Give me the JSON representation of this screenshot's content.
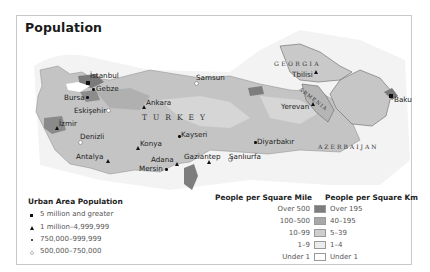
{
  "title": "Population",
  "countries": {
    "turkey": "TURKEY",
    "georgia": "GEORGIA",
    "armenia": "ARMENIA",
    "azerbaijan": "AZERBAIJAN"
  },
  "cities": [
    {
      "name": "İstanbul",
      "marker": "square"
    },
    {
      "name": "Gebze",
      "marker": "dot"
    },
    {
      "name": "Bursa",
      "marker": "dot"
    },
    {
      "name": "Eskişehir",
      "marker": "ring"
    },
    {
      "name": "İzmir",
      "marker": "triangle"
    },
    {
      "name": "Denizli",
      "marker": "ring"
    },
    {
      "name": "Antalya",
      "marker": "triangle"
    },
    {
      "name": "Ankara",
      "marker": "triangle"
    },
    {
      "name": "Samsun",
      "marker": "ring"
    },
    {
      "name": "Kayseri",
      "marker": "dot"
    },
    {
      "name": "Konya",
      "marker": "triangle"
    },
    {
      "name": "Adana",
      "marker": "triangle"
    },
    {
      "name": "Mersin",
      "marker": "dot"
    },
    {
      "name": "Gaziantep",
      "marker": "triangle"
    },
    {
      "name": "Şanlıurfa",
      "marker": "ring"
    },
    {
      "name": "Diyarbakır",
      "marker": "dot"
    },
    {
      "name": "Tbilisi",
      "marker": "triangle"
    },
    {
      "name": "Yerevan",
      "marker": "triangle"
    },
    {
      "name": "Baku",
      "marker": "square"
    }
  ],
  "urban_legend": {
    "title": "Urban Area Population",
    "items": [
      {
        "marker": "square",
        "label": "5 million and greater"
      },
      {
        "marker": "triangle",
        "label": "1 million–4,999,999"
      },
      {
        "marker": "dot",
        "label": "750,000–999,999"
      },
      {
        "marker": "ring",
        "label": "500,000–750,000"
      }
    ]
  },
  "density_legend": {
    "mile_title": "People per Square Mile",
    "km_title": "People per Square Km",
    "rows": [
      {
        "mile": "Over 500",
        "km": "Over 195",
        "color": "#7d7d7d"
      },
      {
        "mile": "100–500",
        "km": "40–195",
        "color": "#a8a8a8"
      },
      {
        "mile": "10–99",
        "km": "5–39",
        "color": "#cdcdcd"
      },
      {
        "mile": "1–9",
        "km": "1–4",
        "color": "#ececec"
      },
      {
        "mile": "Under 1",
        "km": "Under 1",
        "color": "#ffffff"
      }
    ]
  }
}
